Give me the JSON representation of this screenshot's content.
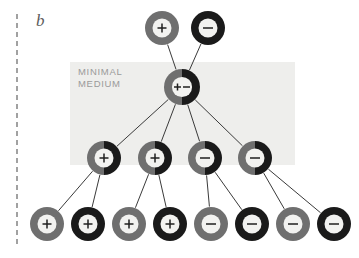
{
  "figure": {
    "panel_label": "b",
    "medium_label": "MINIMAL\nMEDIUM",
    "colors": {
      "gray_ring": "#6f6f6f",
      "black_ring": "#1a1a1a",
      "shaded_background": "#eeeeec",
      "line_color": "#3a3a3a",
      "dashed_divider": "#8a8a8a",
      "label_text": "#9a9a9a",
      "panel_text": "#5b5b5b",
      "cell_fill": "#f2f2f0"
    },
    "shaded_region": {
      "x": 70,
      "y": 62,
      "width": 225,
      "height": 103
    },
    "divider": {
      "x": 17,
      "y1": 14,
      "y2": 248
    },
    "nodes": [
      {
        "id": "t1",
        "row": "top",
        "cx": 162,
        "cy": 28,
        "r": 17,
        "ring": "gray",
        "ring_split": false,
        "sign": "+"
      },
      {
        "id": "t2",
        "row": "top",
        "cx": 208,
        "cy": 28,
        "r": 17,
        "ring": "black",
        "ring_split": false,
        "sign": "−"
      },
      {
        "id": "c1",
        "row": "center",
        "cx": 182,
        "cy": 87,
        "r": 18,
        "ring": "split",
        "ring_split": true,
        "sign": "+−"
      },
      {
        "id": "m1",
        "row": "middle",
        "cx": 104,
        "cy": 158,
        "r": 17,
        "ring": "split",
        "ring_split": true,
        "sign": "+"
      },
      {
        "id": "m2",
        "row": "middle",
        "cx": 155,
        "cy": 158,
        "r": 17,
        "ring": "split",
        "ring_split": true,
        "sign": "+"
      },
      {
        "id": "m3",
        "row": "middle",
        "cx": 205,
        "cy": 158,
        "r": 17,
        "ring": "split",
        "ring_split": true,
        "sign": "−"
      },
      {
        "id": "m4",
        "row": "middle",
        "cx": 255,
        "cy": 158,
        "r": 17,
        "ring": "split",
        "ring_split": true,
        "sign": "−"
      },
      {
        "id": "b1",
        "row": "bottom",
        "cx": 47,
        "cy": 224,
        "r": 17,
        "ring": "gray",
        "ring_split": false,
        "sign": "+"
      },
      {
        "id": "b2",
        "row": "bottom",
        "cx": 88,
        "cy": 224,
        "r": 17,
        "ring": "black",
        "ring_split": false,
        "sign": "+"
      },
      {
        "id": "b3",
        "row": "bottom",
        "cx": 129,
        "cy": 224,
        "r": 17,
        "ring": "gray",
        "ring_split": false,
        "sign": "+"
      },
      {
        "id": "b4",
        "row": "bottom",
        "cx": 170,
        "cy": 224,
        "r": 17,
        "ring": "black",
        "ring_split": false,
        "sign": "+"
      },
      {
        "id": "b5",
        "row": "bottom",
        "cx": 211,
        "cy": 224,
        "r": 17,
        "ring": "gray",
        "ring_split": false,
        "sign": "−"
      },
      {
        "id": "b6",
        "row": "bottom",
        "cx": 252,
        "cy": 224,
        "r": 17,
        "ring": "black",
        "ring_split": false,
        "sign": "−"
      },
      {
        "id": "b7",
        "row": "bottom",
        "cx": 293,
        "cy": 224,
        "r": 17,
        "ring": "gray",
        "ring_split": false,
        "sign": "−"
      },
      {
        "id": "b8",
        "row": "bottom",
        "cx": 334,
        "cy": 224,
        "r": 17,
        "ring": "black",
        "ring_split": false,
        "sign": "−"
      }
    ],
    "edges": [
      {
        "from": "c1",
        "to": "t1"
      },
      {
        "from": "c1",
        "to": "t2"
      },
      {
        "from": "c1",
        "to": "m1"
      },
      {
        "from": "c1",
        "to": "m2"
      },
      {
        "from": "c1",
        "to": "m3"
      },
      {
        "from": "c1",
        "to": "m4"
      },
      {
        "from": "m1",
        "to": "b1"
      },
      {
        "from": "m1",
        "to": "b2"
      },
      {
        "from": "m2",
        "to": "b3"
      },
      {
        "from": "m2",
        "to": "b4"
      },
      {
        "from": "m3",
        "to": "b5"
      },
      {
        "from": "m3",
        "to": "b6"
      },
      {
        "from": "m4",
        "to": "b7"
      },
      {
        "from": "m4",
        "to": "b8"
      }
    ]
  }
}
